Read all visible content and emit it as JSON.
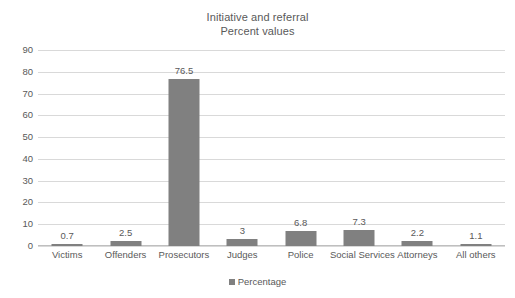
{
  "chart_data": {
    "type": "bar",
    "title": "Initiative and referral",
    "subtitle": "Percent values",
    "xlabel": "",
    "ylabel": "",
    "ylim": [
      0,
      90
    ],
    "ytick_step": 10,
    "yticks": [
      "90",
      "80",
      "70",
      "60",
      "50",
      "40",
      "30",
      "20",
      "10",
      "0"
    ],
    "grid": true,
    "legend_position": "bottom",
    "categories": [
      "Victims",
      "Offenders",
      "Prosecutors",
      "Judges",
      "Police",
      "Social Services",
      "Attorneys",
      "All others"
    ],
    "values": [
      0.7,
      2.5,
      76.5,
      3,
      6.8,
      7.3,
      2.2,
      1.1
    ],
    "data_labels": [
      "0.7",
      "2.5",
      "76.5",
      "3",
      "6.8",
      "7.3",
      "2.2",
      "1.1"
    ],
    "series": [
      {
        "name": "Percentage",
        "values": [
          0.7,
          2.5,
          76.5,
          3,
          6.8,
          7.3,
          2.2,
          1.1
        ],
        "color": "#808080"
      }
    ],
    "legend": [
      "Percentage"
    ],
    "colors": {
      "bar": "#808080",
      "gridline": "#d9d9d9",
      "axis": "#bfbfbf",
      "text": "#595959",
      "background": "#ffffff"
    }
  }
}
